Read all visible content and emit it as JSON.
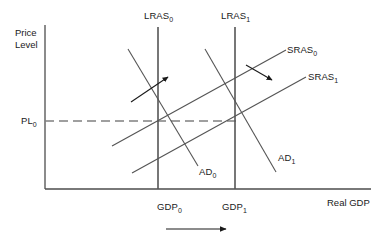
{
  "figure": {
    "type": "economics-as-ad-diagram",
    "background_color": "#ffffff",
    "line_color": "#555555",
    "axis_color": "#4d4d4d",
    "dash_color": "#808080",
    "text_color": "#1a1a1a"
  },
  "axes": {
    "y_axis_label_line1": "Price",
    "y_axis_label_line2": "Level",
    "x_axis_label": "Real GDP",
    "y_axis": {
      "x": 45,
      "y_top": 25,
      "y_bottom": 189
    },
    "x_axis": {
      "y": 189,
      "x_left": 45,
      "x_right": 371
    }
  },
  "price_level": {
    "label": "PL",
    "subscript": "0",
    "y": 121,
    "dash_from_x": 45,
    "dash_to_x": 240
  },
  "gdp_marks": [
    {
      "label": "GDP",
      "subscript": "0",
      "x": 158,
      "text_x": 157,
      "text_y": 201
    },
    {
      "label": "GDP",
      "subscript": "1",
      "x": 235,
      "text_x": 222,
      "text_y": 201
    }
  ],
  "curves": [
    {
      "name": "LRAS",
      "subscript": "0",
      "kind": "vertical",
      "x1": 158,
      "y1": 27,
      "x2": 158,
      "y2": 189,
      "label_x": 144,
      "label_y": 10
    },
    {
      "name": "LRAS",
      "subscript": "1",
      "kind": "vertical",
      "x1": 235,
      "y1": 27,
      "x2": 235,
      "y2": 189,
      "label_x": 221,
      "label_y": 10
    },
    {
      "name": "SRAS",
      "subscript": "0",
      "kind": "upward-sloping",
      "x1": 112,
      "y1": 146,
      "x2": 286,
      "y2": 50,
      "label_x": 287,
      "label_y": 44
    },
    {
      "name": "SRAS",
      "subscript": "1",
      "kind": "upward-sloping",
      "x1": 132,
      "y1": 173,
      "x2": 306,
      "y2": 77,
      "label_x": 308,
      "label_y": 71
    },
    {
      "name": "AD",
      "subscript": "0",
      "kind": "downward-sloping",
      "x1": 128,
      "y1": 49,
      "x2": 198,
      "y2": 166,
      "label_x": 198,
      "label_y": 165
    },
    {
      "name": "AD",
      "subscript": "1",
      "kind": "downward-sloping",
      "x1": 205,
      "y1": 49,
      "x2": 276,
      "y2": 172,
      "label_x": 277,
      "label_y": 151
    }
  ],
  "shift_arrows": [
    {
      "name": "ad-shift-arrow",
      "direction": "up-right",
      "x1": 131,
      "y1": 102,
      "x2": 170,
      "y2": 75
    },
    {
      "name": "sras-shift-arrow",
      "direction": "down-right",
      "x1": 246,
      "y1": 65,
      "x2": 274,
      "y2": 82
    },
    {
      "name": "gdp-growth-arrow",
      "direction": "right",
      "x1": 166,
      "y1": 229,
      "x2": 228,
      "y2": 229
    }
  ]
}
